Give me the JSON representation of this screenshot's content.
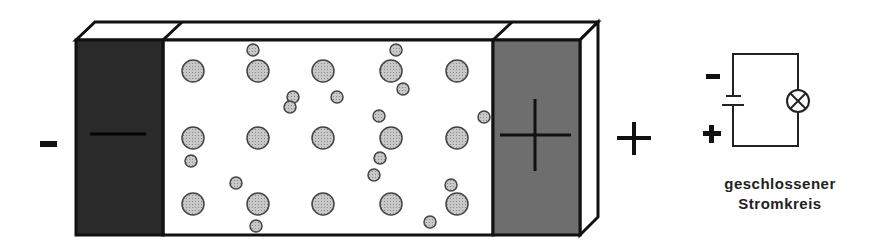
{
  "diagram": {
    "colors": {
      "outline": "#111111",
      "cathode_fill": "#2a2a2a",
      "anode_fill": "#6e6e6e",
      "particle_fill": "#c4c4c4",
      "particle_stroke": "#444444",
      "background": "#ffffff"
    },
    "left_terminal_label": "-",
    "right_terminal_label": "+",
    "cathode_symbol": "minus",
    "anode_symbol": "plus",
    "large_particles": [
      [
        193,
        71
      ],
      [
        258,
        71
      ],
      [
        323,
        71
      ],
      [
        391,
        71
      ],
      [
        457,
        71
      ],
      [
        193,
        138
      ],
      [
        258,
        138
      ],
      [
        323,
        138
      ],
      [
        391,
        138
      ],
      [
        457,
        138
      ],
      [
        193,
        204
      ],
      [
        258,
        204
      ],
      [
        323,
        204
      ],
      [
        391,
        204
      ],
      [
        457,
        204
      ]
    ],
    "small_particles": [
      [
        253,
        50
      ],
      [
        293,
        97
      ],
      [
        290,
        107
      ],
      [
        191,
        161
      ],
      [
        236,
        183
      ],
      [
        256,
        226
      ],
      [
        396,
        50
      ],
      [
        403,
        89
      ],
      [
        337,
        97
      ],
      [
        379,
        116
      ],
      [
        484,
        117
      ],
      [
        380,
        158
      ],
      [
        374,
        175
      ],
      [
        451,
        185
      ],
      [
        430,
        222
      ]
    ]
  },
  "circuit": {
    "minus_label": "-",
    "plus_label": "+",
    "caption_line1": "geschlossener",
    "caption_line2": "Stromkreis",
    "components": [
      "battery-symbol",
      "lamp-symbol"
    ]
  }
}
